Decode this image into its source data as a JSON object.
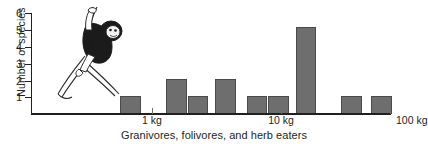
{
  "chart_data": {
    "type": "bar",
    "title": "",
    "subtitle": "",
    "xlabel": "Granivores, folivores, and herb eaters",
    "ylabel": "Number of species",
    "xlim_labels": [
      "1 kg",
      "10 kg",
      "100 kg"
    ],
    "x_tick_values": [
      1,
      10,
      100
    ],
    "x_scale": "log",
    "ylim": [
      0,
      6
    ],
    "y_ticks": [
      1,
      2,
      3,
      4,
      5,
      6
    ],
    "grid": false,
    "legend": "none",
    "bar_color": "#6e6e6e",
    "axis_color": "#231f20",
    "bins": [
      {
        "label": "bin-1",
        "value": 1,
        "x_left_px": 120,
        "x_right_px": 141
      },
      {
        "label": "bin-2",
        "value": 2,
        "x_left_px": 166,
        "x_right_px": 187
      },
      {
        "label": "bin-3",
        "value": 1,
        "x_left_px": 188,
        "x_right_px": 208
      },
      {
        "label": "bin-4",
        "value": 2,
        "x_left_px": 215,
        "x_right_px": 236
      },
      {
        "label": "bin-5",
        "value": 1,
        "x_left_px": 247,
        "x_right_px": 267
      },
      {
        "label": "bin-6",
        "value": 1,
        "x_left_px": 268,
        "x_right_px": 289
      },
      {
        "label": "bin-7",
        "value": 5,
        "x_left_px": 296,
        "x_right_px": 316
      },
      {
        "label": "bin-8",
        "value": 1,
        "x_left_px": 341,
        "x_right_px": 362
      },
      {
        "label": "bin-9",
        "value": 1,
        "x_left_px": 371,
        "x_right_px": 392
      }
    ],
    "values": [
      1,
      2,
      1,
      2,
      1,
      1,
      5,
      1,
      1
    ],
    "annotations": [
      {
        "name": "primate-illustration",
        "description": "line drawing of a gibbon-like primate hanging from branches"
      }
    ]
  },
  "axes": {
    "y_title": "Number of species",
    "y_labels": [
      "6",
      "5",
      "4",
      "3",
      "2",
      "1"
    ],
    "x_title": "Granivores, folivores, and herb eaters",
    "x_labels": [
      "1 kg",
      "10 kg",
      "100 kg"
    ]
  }
}
